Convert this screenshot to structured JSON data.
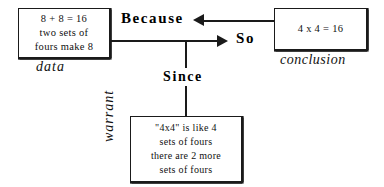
{
  "diagram": {
    "type": "toulmin-argument-diagram",
    "nodes": {
      "data": {
        "role_label": "data",
        "lines": [
          "8 + 8 = 16",
          "two sets of",
          "fours  make  8"
        ]
      },
      "conclusion": {
        "role_label": "conclusion",
        "lines": [
          "4  x  4  =  16"
        ]
      },
      "warrant": {
        "role_label": "warrant",
        "lines": [
          "\"4x4\"  is  like  4",
          "sets  of  fours",
          "there  are  2  more",
          "sets  of  fours"
        ]
      }
    },
    "connectors": {
      "because": {
        "label": "Because",
        "arrow": "left-arrow-icon",
        "from": "conclusion",
        "to": "data"
      },
      "so": {
        "label": "So",
        "arrow": "right-arrow-icon",
        "from": "data",
        "to": "conclusion"
      },
      "since": {
        "label": "Since",
        "arrow": "none",
        "from": "so-edge",
        "to": "warrant"
      }
    },
    "colors": {
      "ink": "#1a1a1a",
      "background": "#ffffff"
    }
  }
}
